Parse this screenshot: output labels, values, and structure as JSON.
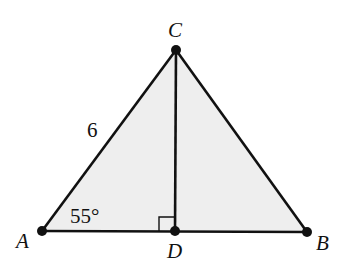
{
  "diagram": {
    "type": "triangle-with-altitude",
    "colors": {
      "fill": "#eeeeee",
      "stroke": "#111111",
      "point": "#111111"
    },
    "points": {
      "A": {
        "label": "A",
        "x": 42,
        "y": 231
      },
      "B": {
        "label": "B",
        "x": 307,
        "y": 232
      },
      "C": {
        "label": "C",
        "x": 176,
        "y": 50
      },
      "D": {
        "label": "D",
        "x": 175,
        "y": 231
      }
    },
    "segments": [
      "AB",
      "BC",
      "CA",
      "CD"
    ],
    "side_label_AC": "6",
    "angle_label_A": "55°",
    "right_angle_at": "D"
  }
}
